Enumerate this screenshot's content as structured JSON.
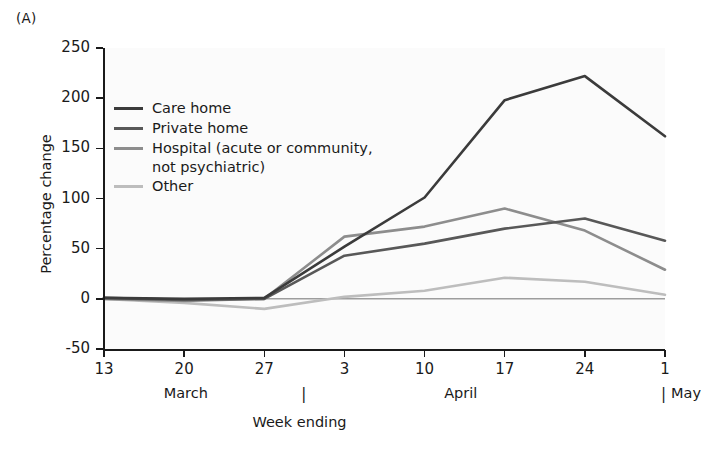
{
  "panel": {
    "label": "(A)"
  },
  "axes": {
    "ylabel": "Percentage change",
    "xlabel": "Week ending",
    "yticks": [
      "250",
      "200",
      "150",
      "100",
      "50",
      "0",
      "-50"
    ],
    "xticks": [
      "13",
      "20",
      "27",
      "3",
      "10",
      "17",
      "24",
      "1"
    ],
    "months": [
      "March",
      "April",
      "May"
    ]
  },
  "legend": {
    "entries": [
      {
        "label": "Care home",
        "color": "#3b3b3b"
      },
      {
        "label": "Private home",
        "color": "#585858"
      },
      {
        "label": "Hospital (acute or community,\nnot psychiatric)",
        "color": "#8d8d8d"
      },
      {
        "label": "Other",
        "color": "#bdbdbd"
      }
    ]
  },
  "chart_data": {
    "type": "line",
    "title": "",
    "subtitle": "",
    "xlabel": "Week ending",
    "ylabel": "Percentage change",
    "x": [
      "13",
      "20",
      "27",
      "3",
      "10",
      "17",
      "24",
      "1"
    ],
    "x_month": [
      "March",
      "March",
      "March",
      "April",
      "April",
      "April",
      "April",
      "May"
    ],
    "xlim": [
      0,
      7
    ],
    "ylim": [
      -50,
      250
    ],
    "ytick_values": [
      -50,
      0,
      50,
      100,
      150,
      200,
      250
    ],
    "grid": false,
    "legend_position": "upper left inside axes",
    "zero_line": true,
    "series": [
      {
        "name": "Care home",
        "color": "#3b3b3b",
        "values": [
          1,
          0,
          1,
          52,
          101,
          198,
          222,
          162
        ]
      },
      {
        "name": "Private home",
        "color": "#585858",
        "values": [
          1,
          -1,
          0,
          43,
          55,
          70,
          80,
          58
        ]
      },
      {
        "name": "Hospital (acute or community, not psychiatric)",
        "color": "#8d8d8d",
        "values": [
          0,
          -2,
          0,
          62,
          72,
          90,
          68,
          29
        ]
      },
      {
        "name": "Other",
        "color": "#bdbdbd",
        "values": [
          0,
          -4,
          -10,
          2,
          8,
          21,
          17,
          4
        ]
      }
    ]
  }
}
